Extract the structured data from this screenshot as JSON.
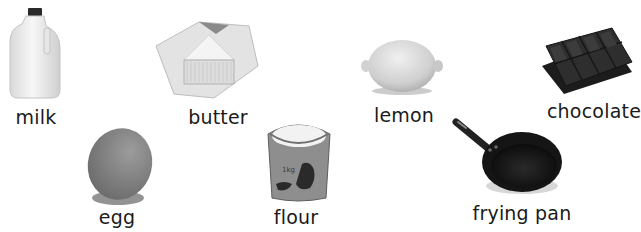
{
  "items": [
    {
      "id": "milk",
      "label": "milk",
      "icon": "milk-jug-icon"
    },
    {
      "id": "butter",
      "label": "butter",
      "icon": "butter-block-icon"
    },
    {
      "id": "lemon",
      "label": "lemon",
      "icon": "lemon-icon"
    },
    {
      "id": "chocolate",
      "label": "chocolate",
      "icon": "chocolate-bar-icon"
    },
    {
      "id": "egg",
      "label": "egg",
      "icon": "egg-icon"
    },
    {
      "id": "flour",
      "label": "flour",
      "icon": "flour-sack-icon"
    },
    {
      "id": "frying_pan",
      "label": "frying pan",
      "icon": "frying-pan-icon"
    }
  ],
  "colors": {
    "background": "#ffffff",
    "text": "#1a1a1a"
  }
}
